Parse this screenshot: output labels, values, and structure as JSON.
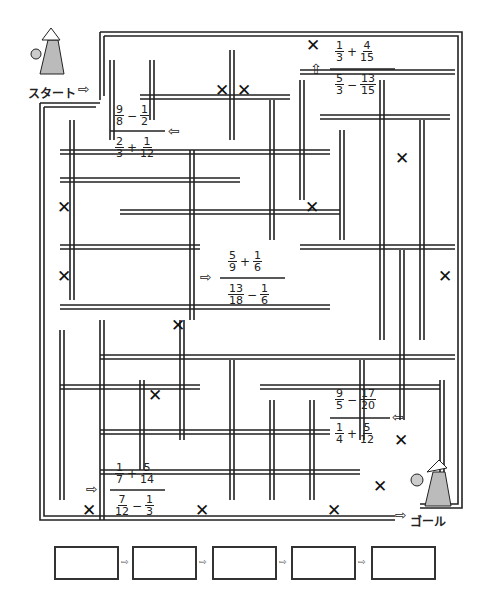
{
  "start": {
    "label": "スタート",
    "arrow": "⇨"
  },
  "goal": {
    "label": "ゴール",
    "arrow": "⇨"
  },
  "problems": [
    {
      "id": "p1",
      "top": {
        "a": [
          "1",
          "3"
        ],
        "op": "+",
        "b": [
          "4",
          "15"
        ]
      },
      "bottom": {
        "a": [
          "5",
          "3"
        ],
        "op": "−",
        "b": [
          "13",
          "15"
        ]
      },
      "arrow": "⇧"
    },
    {
      "id": "p2",
      "top": {
        "a": [
          "9",
          "8"
        ],
        "op": "−",
        "b": [
          "1",
          "2"
        ]
      },
      "bottom": {
        "a": [
          "2",
          "3"
        ],
        "op": "+",
        "b": [
          "1",
          "12"
        ]
      },
      "arrow": "⇦"
    },
    {
      "id": "p3",
      "top": {
        "a": [
          "5",
          "9"
        ],
        "op": "+",
        "b": [
          "1",
          "6"
        ]
      },
      "bottom": {
        "a": [
          "13",
          "18"
        ],
        "op": "−",
        "b": [
          "1",
          "6"
        ]
      },
      "arrow": "⇨"
    },
    {
      "id": "p4",
      "top": {
        "a": [
          "9",
          "5"
        ],
        "op": "−",
        "b": [
          "17",
          "20"
        ]
      },
      "bottom": {
        "a": [
          "1",
          "4"
        ],
        "op": "+",
        "b": [
          "5",
          "12"
        ]
      },
      "arrow": "⇦"
    },
    {
      "id": "p5",
      "top": {
        "a": [
          "1",
          "7"
        ],
        "op": "+",
        "b": [
          "5",
          "14"
        ]
      },
      "bottom": {
        "a": [
          "7",
          "12"
        ],
        "op": "−",
        "b": [
          "1",
          "3"
        ]
      },
      "arrow": "⇨"
    }
  ],
  "x_marks": {
    "glyph": "✕",
    "count": 14
  },
  "answer_boxes": {
    "count": 5,
    "values": [
      "",
      "",
      "",
      "",
      ""
    ],
    "arrow": "⇨"
  }
}
